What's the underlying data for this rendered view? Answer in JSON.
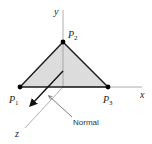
{
  "diagram": {
    "axes": {
      "x_label": "x",
      "y_label": "y",
      "z_label": "z"
    },
    "points": [
      {
        "id": "P1",
        "label": "P",
        "subscript": "1"
      },
      {
        "id": "P2",
        "label": "P",
        "subscript": "2"
      },
      {
        "id": "P3",
        "label": "P",
        "subscript": "3"
      }
    ],
    "normal_label": "Normal",
    "colors": {
      "triangle_fill": "#dcdcdc",
      "triangle_edge": "#1a1a1a",
      "axis": "#9a9a9a",
      "point": "#000000"
    }
  }
}
